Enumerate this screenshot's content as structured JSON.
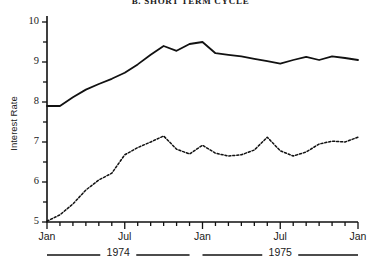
{
  "title": "B. SHORT TERM CYCLE",
  "axes": {
    "ylabel": "Interest Rate",
    "yticks": [
      "5",
      "6",
      "7",
      "8",
      "9",
      "10"
    ],
    "xticks": [
      "Jan",
      "Jul",
      "Jan",
      "Jul",
      "Jan"
    ],
    "years": [
      "1974",
      "1975"
    ]
  },
  "chart_data": {
    "type": "line",
    "title": "B. SHORT TERM CYCLE",
    "xlabel": "",
    "ylabel": "Interest Rate",
    "ylim": [
      5,
      10
    ],
    "xlim": [
      0,
      24
    ],
    "grid": false,
    "legend": "none",
    "x_tick_positions": [
      0,
      6,
      12,
      18,
      24
    ],
    "x_tick_labels": [
      "Jan",
      "Jul",
      "Jan",
      "Jul",
      "Jan"
    ],
    "y_tick_values": [
      5,
      6,
      7,
      8,
      9,
      10
    ],
    "y_minor_tick_values": [
      5.5,
      6.5,
      7.5,
      8.5,
      9.5
    ],
    "x_minor_ticks_monthly": true,
    "year_brackets": [
      {
        "label": "1974",
        "start": 0,
        "end": 11
      },
      {
        "label": "1975",
        "start": 12,
        "end": 24
      }
    ],
    "x": [
      0,
      1,
      2,
      3,
      4,
      5,
      6,
      7,
      8,
      9,
      10,
      11,
      12,
      13,
      14,
      15,
      16,
      17,
      18,
      19,
      20,
      21,
      22,
      23,
      24
    ],
    "x_month_labels": [
      "Jan 1974",
      "Feb 1974",
      "Mar 1974",
      "Apr 1974",
      "May 1974",
      "Jun 1974",
      "Jul 1974",
      "Aug 1974",
      "Sep 1974",
      "Oct 1974",
      "Nov 1974",
      "Dec 1974",
      "Jan 1975",
      "Feb 1975",
      "Mar 1975",
      "Apr 1975",
      "May 1975",
      "Jun 1975",
      "Jul 1975",
      "Aug 1975",
      "Sep 1975",
      "Oct 1975",
      "Nov 1975",
      "Dec 1975",
      "Jan 1976"
    ],
    "series": [
      {
        "name": "long-term-rate",
        "style": "solid",
        "values": [
          7.9,
          7.9,
          8.12,
          8.31,
          8.45,
          8.58,
          8.73,
          8.94,
          9.18,
          9.4,
          9.28,
          9.45,
          9.5,
          9.22,
          9.18,
          9.14,
          9.08,
          9.02,
          8.96,
          9.05,
          9.13,
          9.05,
          9.14,
          9.1,
          9.05
        ]
      },
      {
        "name": "short-term-rate",
        "style": "dotted",
        "values": [
          5.02,
          5.18,
          5.45,
          5.8,
          6.05,
          6.22,
          6.68,
          6.86,
          7.0,
          7.15,
          6.82,
          6.7,
          6.92,
          6.72,
          6.65,
          6.68,
          6.8,
          7.12,
          6.78,
          6.65,
          6.75,
          6.95,
          7.02,
          7.0,
          7.12
        ]
      }
    ]
  }
}
